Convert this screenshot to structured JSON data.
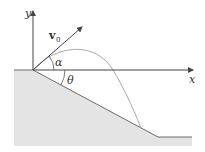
{
  "diagram": {
    "labels": {
      "y_axis": "y",
      "x_axis": "x",
      "velocity": "v",
      "velocity_subscript": "0",
      "launch_angle": "α",
      "incline_angle": "θ"
    },
    "colors": {
      "ground_fill": "#e4e4e4",
      "ground_edge": "#6b6b6b",
      "axis": "#444444",
      "trajectory": "#a8a8a8",
      "text": "#333333"
    }
  }
}
